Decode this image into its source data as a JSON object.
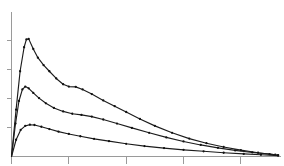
{
  "chart_data": {
    "type": "line",
    "title": "",
    "subtitle": "",
    "xlabel": "",
    "ylabel": "",
    "legend": [],
    "legend_position": "none",
    "grid": false,
    "tick_labels_visible": false,
    "xlim": [
      0,
      4.7
    ],
    "ylim": [
      0,
      5.0
    ],
    "x_ticks": [
      0,
      1,
      2,
      3,
      4
    ],
    "y_ticks": [
      0,
      1,
      2,
      3,
      4
    ],
    "x_tick_labels": [
      "",
      "",
      "",
      "",
      ""
    ],
    "y_tick_labels": [
      "",
      "",
      "",
      "",
      ""
    ],
    "marker": "dot",
    "series": [
      {
        "name": "series-1-upper",
        "color": "#1c1c1c",
        "x": [
          0.0,
          0.08,
          0.15,
          0.22,
          0.26,
          0.3,
          0.38,
          0.46,
          0.56,
          0.66,
          0.78,
          0.9,
          1.0,
          1.12,
          1.24,
          1.4,
          1.6,
          1.8,
          2.0,
          2.24,
          2.5,
          2.8,
          3.1,
          3.4,
          3.7,
          4.0,
          4.3,
          4.6
        ],
        "y": [
          0.0,
          1.62,
          2.95,
          3.78,
          4.05,
          4.07,
          3.72,
          3.42,
          3.16,
          2.95,
          2.7,
          2.5,
          2.42,
          2.41,
          2.32,
          2.16,
          1.94,
          1.74,
          1.54,
          1.3,
          1.06,
          0.82,
          0.62,
          0.46,
          0.33,
          0.22,
          0.13,
          0.06
        ]
      },
      {
        "name": "series-2-middle",
        "color": "#1c1c1c",
        "x": [
          0.0,
          0.07,
          0.13,
          0.19,
          0.24,
          0.3,
          0.38,
          0.48,
          0.6,
          0.74,
          0.9,
          1.06,
          1.22,
          1.4,
          1.6,
          1.84,
          2.1,
          2.4,
          2.7,
          3.0,
          3.3,
          3.6,
          3.9,
          4.2,
          4.5,
          4.65
        ],
        "y": [
          0.0,
          1.14,
          1.92,
          2.32,
          2.42,
          2.36,
          2.2,
          2.02,
          1.84,
          1.68,
          1.56,
          1.48,
          1.44,
          1.38,
          1.28,
          1.14,
          0.99,
          0.82,
          0.66,
          0.52,
          0.4,
          0.3,
          0.21,
          0.14,
          0.08,
          0.05
        ]
      },
      {
        "name": "series-3-lower",
        "color": "#1c1c1c",
        "x": [
          0.0,
          0.08,
          0.16,
          0.24,
          0.32,
          0.4,
          0.52,
          0.66,
          0.82,
          1.0,
          1.2,
          1.44,
          1.7,
          2.0,
          2.32,
          2.66,
          3.0,
          3.35,
          3.7,
          4.05,
          4.35,
          4.65
        ],
        "y": [
          0.0,
          0.58,
          0.92,
          1.06,
          1.1,
          1.09,
          1.03,
          0.95,
          0.86,
          0.78,
          0.7,
          0.61,
          0.53,
          0.44,
          0.36,
          0.29,
          0.23,
          0.18,
          0.13,
          0.09,
          0.06,
          0.03
        ]
      }
    ]
  },
  "axes": {
    "axis_color": "#9a9a9a",
    "series_color": "#1c1c1c",
    "background": "#ffffff"
  }
}
